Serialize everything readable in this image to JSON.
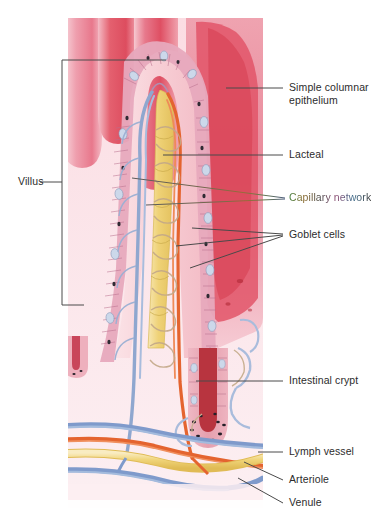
{
  "figure": {
    "panel": {
      "left": 68,
      "top": 18,
      "width": 195,
      "height": 490
    }
  },
  "labels": {
    "villus": "Villus",
    "simple_columnar_epithelium": "Simple columnar epithelium",
    "lacteal": "Lacteal",
    "capillary_network": "Capillary network",
    "goblet_cells": "Goblet cells",
    "intestinal_crypt": "Intestinal crypt",
    "lymph_vessel": "Lymph vessel",
    "arteriole": "Arteriole",
    "venule": "Venule"
  },
  "structures": [
    {
      "name": "villus",
      "label": "Villus",
      "marker": "bracket",
      "side": "left"
    },
    {
      "name": "simple-columnar-epithelium",
      "label": "Simple columnar epithelium",
      "marker": "leader-line",
      "side": "right",
      "leaders": 1
    },
    {
      "name": "lacteal",
      "label": "Lacteal",
      "marker": "leader-line",
      "side": "right",
      "leaders": 1
    },
    {
      "name": "capillary-network",
      "label": "Capillary network",
      "marker": "leader-line",
      "side": "right",
      "leaders": 2
    },
    {
      "name": "goblet-cells",
      "label": "Goblet cells",
      "marker": "leader-line",
      "side": "right",
      "leaders": 3
    },
    {
      "name": "intestinal-crypt",
      "label": "Intestinal crypt",
      "marker": "leader-line",
      "side": "right",
      "leaders": 1
    },
    {
      "name": "lymph-vessel",
      "label": "Lymph vessel",
      "marker": "leader-line",
      "side": "right",
      "leaders": 1
    },
    {
      "name": "arteriole",
      "label": "Arteriole",
      "marker": "leader-line",
      "side": "right",
      "leaders": 1
    },
    {
      "name": "venule",
      "label": "Venule",
      "marker": "leader-line",
      "side": "right",
      "leaders": 1
    }
  ],
  "colors": {
    "background": "#ffffff",
    "mucosa_pale": "#fbe6ea",
    "mucosa_pink": "#f3aab6",
    "mucosa_deep": "#e0596a",
    "villus_core": "#f7c9cf",
    "epithelium": "#e7a9bd",
    "goblet_cell": "#cfd9ea",
    "lacteal_yellow": "#f2d98a",
    "lymph_yellow": "#f5dc93",
    "capillary_blue": "#8fa7cf",
    "arteriole_red": "#e4642f",
    "venule_blue": "#7f9acb",
    "crypt_lumen": "#b8343f",
    "leader_line": "#4a4a4a",
    "bracket": "#4a4a4a",
    "label_text": "#2c2c2c",
    "capillary_label_gradient": [
      "#3f7d3a",
      "#8a6a2e",
      "#8c4a72",
      "#3f6d8c"
    ]
  }
}
